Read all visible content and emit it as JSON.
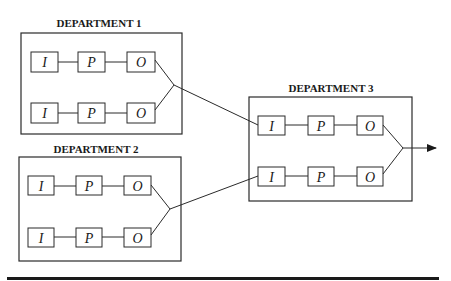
{
  "diagram": {
    "departments": [
      {
        "id": "dept1",
        "title": "DEPARTMENT 1",
        "rows": [
          {
            "input": "I",
            "process": "P",
            "output": "O"
          },
          {
            "input": "I",
            "process": "P",
            "output": "O"
          }
        ]
      },
      {
        "id": "dept2",
        "title": "DEPARTMENT 2",
        "rows": [
          {
            "input": "I",
            "process": "P",
            "output": "O"
          },
          {
            "input": "I",
            "process": "P",
            "output": "O"
          }
        ]
      },
      {
        "id": "dept3",
        "title": "DEPARTMENT 3",
        "rows": [
          {
            "input": "I",
            "process": "P",
            "output": "O"
          },
          {
            "input": "I",
            "process": "P",
            "output": "O"
          }
        ]
      }
    ],
    "connections": [
      {
        "from": "dept1.merged_output",
        "to": "dept3.row1.input"
      },
      {
        "from": "dept2.merged_output",
        "to": "dept3.row2.input"
      },
      {
        "from": "dept3.merged_output",
        "to": "exit-arrow"
      }
    ],
    "colors": {
      "stroke": "#2a2a2a",
      "text": "#1a1a1a",
      "background": "#ffffff"
    }
  }
}
